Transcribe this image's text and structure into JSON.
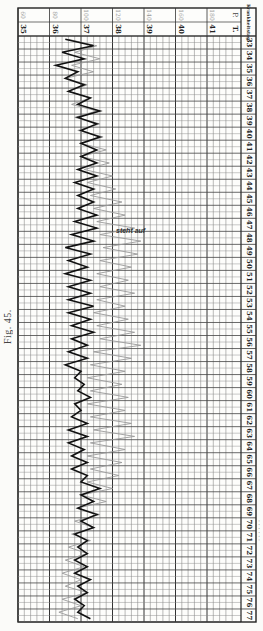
{
  "figure": {
    "label": "Fig. 45.",
    "side_caption": "· · · · · ·"
  },
  "header": {
    "corner_label": "Krankheitstag",
    "pulse_label": "P.",
    "temp_label": "T.",
    "annotation": "steht auf"
  },
  "chart_data": {
    "type": "line",
    "orientation": "rotated 90° — days run top→bottom, values left→right",
    "xlabel": "Krankheitstag",
    "ylabel": "T. (°C) / P.",
    "x": [
      33,
      34,
      35,
      36,
      37,
      38,
      39,
      40,
      41,
      42,
      43,
      44,
      45,
      46,
      47,
      48,
      49,
      50,
      51,
      52,
      53,
      54,
      55,
      56,
      57,
      58,
      59,
      60,
      61,
      62,
      63,
      64,
      65,
      66,
      67,
      68,
      69,
      70,
      71,
      72,
      73,
      74,
      75,
      76,
      77
    ],
    "temp_ticks": [
      35,
      36,
      37,
      38,
      39,
      40,
      41
    ],
    "pulse_ticks": [
      60,
      80,
      100,
      120,
      140,
      160,
      180
    ],
    "ylim_temp": [
      35,
      41.8
    ],
    "ylim_pulse": [
      60,
      196
    ],
    "grid": true,
    "annotations": [
      {
        "day": 47.5,
        "text": "steht auf"
      }
    ],
    "series": [
      {
        "name": "Temperatur (T.)",
        "style": "solid dark",
        "values_morning_evening": [
          [
            36.5,
            37.4
          ],
          [
            36.4,
            37.1
          ],
          [
            36.2,
            36.9
          ],
          [
            36.5,
            37.1
          ],
          [
            36.6,
            37.3
          ],
          [
            36.9,
            37.6
          ],
          [
            36.9,
            37.5
          ],
          [
            37.0,
            37.6
          ],
          [
            37.0,
            37.5
          ],
          [
            37.0,
            37.5
          ],
          [
            36.9,
            37.5
          ],
          [
            36.8,
            37.4
          ],
          [
            36.9,
            37.4
          ],
          [
            36.9,
            37.5
          ],
          [
            36.8,
            37.5
          ],
          [
            36.7,
            37.4
          ],
          [
            36.5,
            37.3
          ],
          [
            36.6,
            37.2
          ],
          [
            36.5,
            37.3
          ],
          [
            36.6,
            37.3
          ],
          [
            36.6,
            37.4
          ],
          [
            36.6,
            37.3
          ],
          [
            36.7,
            37.4
          ],
          [
            36.7,
            37.2
          ],
          [
            36.6,
            37.2
          ],
          [
            36.5,
            37.0
          ],
          [
            36.8,
            37.1
          ],
          [
            36.9,
            37.3
          ],
          [
            36.8,
            37.0
          ],
          [
            36.7,
            37.2
          ],
          [
            36.6,
            37.2
          ],
          [
            36.6,
            37.1
          ],
          [
            36.7,
            37.2
          ],
          [
            36.7,
            37.2
          ],
          [
            37.0,
            37.6
          ],
          [
            37.0,
            37.4
          ],
          [
            36.9,
            37.5
          ],
          [
            37.0,
            37.4
          ],
          [
            36.8,
            37.2
          ],
          [
            36.9,
            37.2
          ],
          [
            36.8,
            37.2
          ],
          [
            36.8,
            37.3
          ],
          [
            36.9,
            37.2
          ],
          [
            36.8,
            37.1
          ],
          [
            36.9,
            37.3
          ]
        ]
      },
      {
        "name": "Puls (P.)",
        "style": "thin grey",
        "values_morning_evening": [
          [
            92,
            110
          ],
          [
            96,
            112
          ],
          [
            94,
            108
          ],
          [
            90,
            104
          ],
          [
            92,
            106
          ],
          [
            94,
            110
          ],
          [
            96,
            112
          ],
          [
            98,
            114
          ],
          [
            100,
            116
          ],
          [
            100,
            118
          ],
          [
            102,
            120
          ],
          [
            104,
            122
          ],
          [
            106,
            126
          ],
          [
            108,
            128
          ],
          [
            110,
            134
          ],
          [
            112,
            138
          ],
          [
            114,
            136
          ],
          [
            112,
            132
          ],
          [
            110,
            130
          ],
          [
            112,
            134
          ],
          [
            110,
            128
          ],
          [
            108,
            130
          ],
          [
            110,
            134
          ],
          [
            112,
            138
          ],
          [
            108,
            132
          ],
          [
            106,
            128
          ],
          [
            104,
            126
          ],
          [
            106,
            130
          ],
          [
            104,
            128
          ],
          [
            106,
            132
          ],
          [
            108,
            134
          ],
          [
            106,
            128
          ],
          [
            104,
            126
          ],
          [
            106,
            124
          ],
          [
            104,
            120
          ],
          [
            100,
            116
          ],
          [
            98,
            112
          ],
          [
            96,
            108
          ],
          [
            94,
            106
          ],
          [
            92,
            104
          ],
          [
            90,
            102
          ],
          [
            88,
            100
          ],
          [
            90,
            104
          ],
          [
            88,
            100
          ],
          [
            86,
            98
          ]
        ]
      }
    ]
  }
}
